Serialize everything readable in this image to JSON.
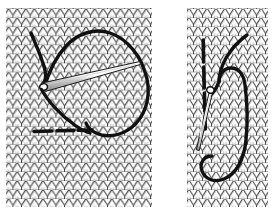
{
  "figure": {
    "background_color": "#ffffff",
    "width": 277,
    "height": 215,
    "panel_count": 2,
    "caption": ""
  },
  "colors": {
    "background": "#ffffff",
    "fabric_line": "#3b3b3b",
    "fabric_shadow": "#8c8c8c",
    "yarn": "#111111",
    "needle_body": "#ffffff",
    "needle_outline": "#1a1a1a",
    "needle_shade": "#9a9a9a"
  },
  "panels": [
    {
      "id": "panel-left",
      "label": "Left panel",
      "description": "Knitted stockinette fabric with threaded tapestry needle entering a stitch; dark working yarn forms a large open loop to the right and a horizontal float runs beneath the stitches.",
      "x": 6,
      "y": 8,
      "width": 146,
      "height": 199,
      "fabric": {
        "pattern": "stockinette-v-stitch",
        "columns": 17,
        "rows": 22,
        "stitch_width": 8.6,
        "stitch_height": 9.05
      },
      "yarn": {
        "name": "working-yarn",
        "stroke_width": 3.4,
        "loop_shape": "large-open-loop",
        "tail_visible": true
      },
      "needle": {
        "name": "tapestry-needle",
        "angle_degrees": 38,
        "tip_x": 139,
        "tip_y": 62,
        "eye_x": 40,
        "eye_y": 88,
        "orientation": "diagonal-down-right"
      },
      "float": {
        "name": "horizontal-float",
        "x1": 34,
        "x2": 90,
        "y": 131,
        "dashed": true
      }
    },
    {
      "id": "panel-right",
      "label": "Right panel",
      "description": "Narrow knitted stockinette panel with a vertical dark yarn column, a tapestry needle angled down-left, and the working yarn pulled into a tall S-shaped loop around the needle.",
      "x": 187,
      "y": 8,
      "width": 81,
      "height": 199,
      "fabric": {
        "pattern": "stockinette-v-stitch",
        "columns": 9,
        "rows": 22,
        "stitch_width": 9.0,
        "stitch_height": 9.05
      },
      "yarn": {
        "name": "working-yarn",
        "stroke_width": 3.4,
        "loop_shape": "s-curve-with-deep-u-loop",
        "tail_visible": true
      },
      "needle": {
        "name": "tapestry-needle",
        "angle_degrees": 70,
        "tip_x": 197,
        "tip_y": 150,
        "eye_x": 222,
        "eye_y": 88,
        "orientation": "diagonal-down-left"
      },
      "vertical_yarn": {
        "name": "vertical-yarn-column",
        "x": 203,
        "y1": 40,
        "y2": 128,
        "dashed": true
      }
    }
  ]
}
